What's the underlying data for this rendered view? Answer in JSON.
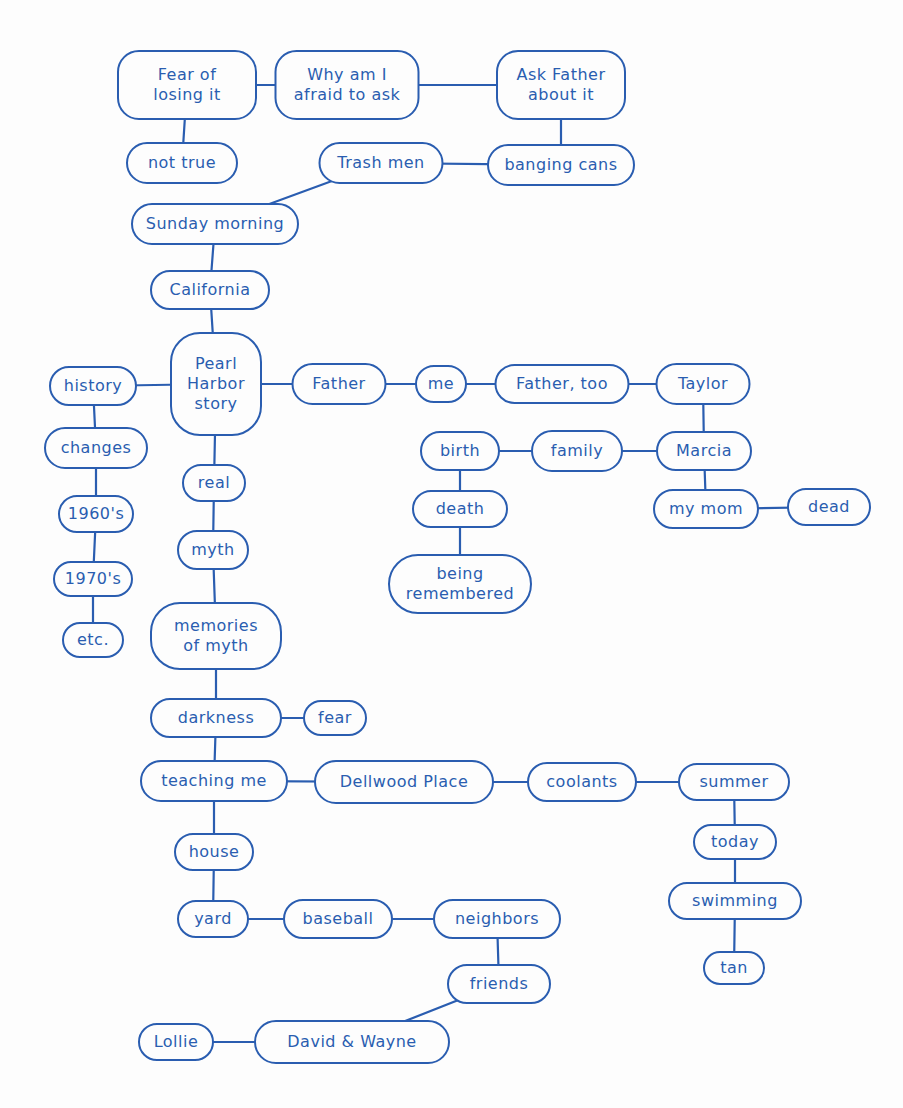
{
  "colors": {
    "stroke": "#2a5db0",
    "background": "#fdfdfd"
  },
  "nodes": [
    {
      "id": "fear-of-losing-it",
      "label": "Fear of\nlosing it",
      "x": 187,
      "y": 85,
      "w": 140,
      "h": 70
    },
    {
      "id": "why-am-i-afraid",
      "label": "Why am I\nafraid to ask",
      "x": 347,
      "y": 85,
      "w": 145,
      "h": 70
    },
    {
      "id": "ask-father",
      "label": "Ask Father\nabout it",
      "x": 561,
      "y": 85,
      "w": 130,
      "h": 70
    },
    {
      "id": "not-true",
      "label": "not true",
      "x": 182,
      "y": 163,
      "w": 112,
      "h": 42
    },
    {
      "id": "trash-men",
      "label": "Trash men",
      "x": 381,
      "y": 163,
      "w": 125,
      "h": 42
    },
    {
      "id": "banging-cans",
      "label": "banging cans",
      "x": 561,
      "y": 165,
      "w": 148,
      "h": 42
    },
    {
      "id": "sunday-morning",
      "label": "Sunday morning",
      "x": 215,
      "y": 224,
      "w": 168,
      "h": 42
    },
    {
      "id": "california",
      "label": "California",
      "x": 210,
      "y": 290,
      "w": 120,
      "h": 40
    },
    {
      "id": "pearl-harbor-story",
      "label": "Pearl\nHarbor\nstory",
      "x": 216,
      "y": 384,
      "w": 92,
      "h": 104,
      "big": true
    },
    {
      "id": "history",
      "label": "history",
      "x": 93,
      "y": 386,
      "w": 88,
      "h": 40
    },
    {
      "id": "father",
      "label": "Father",
      "x": 339,
      "y": 384,
      "w": 95,
      "h": 42
    },
    {
      "id": "me",
      "label": "me",
      "x": 441,
      "y": 384,
      "w": 52,
      "h": 38
    },
    {
      "id": "father-too",
      "label": "Father, too",
      "x": 562,
      "y": 384,
      "w": 135,
      "h": 40
    },
    {
      "id": "taylor",
      "label": "Taylor",
      "x": 703,
      "y": 384,
      "w": 95,
      "h": 42
    },
    {
      "id": "changes",
      "label": "changes",
      "x": 96,
      "y": 448,
      "w": 104,
      "h": 42
    },
    {
      "id": "birth",
      "label": "birth",
      "x": 460,
      "y": 451,
      "w": 80,
      "h": 40
    },
    {
      "id": "family",
      "label": "family",
      "x": 577,
      "y": 451,
      "w": 92,
      "h": 42
    },
    {
      "id": "marcia",
      "label": "Marcia",
      "x": 704,
      "y": 451,
      "w": 96,
      "h": 40
    },
    {
      "id": "real",
      "label": "real",
      "x": 214,
      "y": 483,
      "w": 64,
      "h": 38
    },
    {
      "id": "1960s",
      "label": "1960's",
      "x": 96,
      "y": 514,
      "w": 76,
      "h": 38
    },
    {
      "id": "death",
      "label": "death",
      "x": 460,
      "y": 509,
      "w": 96,
      "h": 38
    },
    {
      "id": "my-mom",
      "label": "my mom",
      "x": 706,
      "y": 509,
      "w": 106,
      "h": 40
    },
    {
      "id": "dead",
      "label": "dead",
      "x": 829,
      "y": 507,
      "w": 84,
      "h": 38
    },
    {
      "id": "myth",
      "label": "myth",
      "x": 213,
      "y": 550,
      "w": 72,
      "h": 40
    },
    {
      "id": "1970s",
      "label": "1970's",
      "x": 93,
      "y": 579,
      "w": 80,
      "h": 36
    },
    {
      "id": "being-remembered",
      "label": "being\nremembered",
      "x": 460,
      "y": 584,
      "w": 144,
      "h": 60,
      "big": true
    },
    {
      "id": "etc",
      "label": "etc.",
      "x": 93,
      "y": 640,
      "w": 62,
      "h": 36
    },
    {
      "id": "memories-of-myth",
      "label": "memories\nof myth",
      "x": 216,
      "y": 636,
      "w": 132,
      "h": 68,
      "big": true
    },
    {
      "id": "darkness",
      "label": "darkness",
      "x": 216,
      "y": 718,
      "w": 132,
      "h": 40
    },
    {
      "id": "fear",
      "label": "fear",
      "x": 335,
      "y": 718,
      "w": 64,
      "h": 36
    },
    {
      "id": "teaching-me",
      "label": "teaching me",
      "x": 214,
      "y": 781,
      "w": 148,
      "h": 42
    },
    {
      "id": "dellwood-place",
      "label": "Dellwood Place",
      "x": 404,
      "y": 782,
      "w": 180,
      "h": 44
    },
    {
      "id": "coolants",
      "label": "coolants",
      "x": 582,
      "y": 782,
      "w": 110,
      "h": 40
    },
    {
      "id": "summer",
      "label": "summer",
      "x": 734,
      "y": 782,
      "w": 112,
      "h": 38
    },
    {
      "id": "house",
      "label": "house",
      "x": 214,
      "y": 852,
      "w": 80,
      "h": 38
    },
    {
      "id": "today",
      "label": "today",
      "x": 735,
      "y": 842,
      "w": 84,
      "h": 36
    },
    {
      "id": "swimming",
      "label": "swimming",
      "x": 735,
      "y": 901,
      "w": 134,
      "h": 38
    },
    {
      "id": "yard",
      "label": "yard",
      "x": 213,
      "y": 919,
      "w": 72,
      "h": 38
    },
    {
      "id": "baseball",
      "label": "baseball",
      "x": 338,
      "y": 919,
      "w": 110,
      "h": 40
    },
    {
      "id": "neighbors",
      "label": "neighbors",
      "x": 497,
      "y": 919,
      "w": 128,
      "h": 40
    },
    {
      "id": "tan",
      "label": "tan",
      "x": 734,
      "y": 968,
      "w": 62,
      "h": 34
    },
    {
      "id": "friends",
      "label": "friends",
      "x": 499,
      "y": 984,
      "w": 104,
      "h": 40
    },
    {
      "id": "lollie",
      "label": "Lollie",
      "x": 176,
      "y": 1042,
      "w": 76,
      "h": 38
    },
    {
      "id": "david-wayne",
      "label": "David & Wayne",
      "x": 352,
      "y": 1042,
      "w": 196,
      "h": 44
    }
  ],
  "links": [
    [
      "fear-of-losing-it",
      "why-am-i-afraid"
    ],
    [
      "why-am-i-afraid",
      "ask-father"
    ],
    [
      "fear-of-losing-it",
      "not-true"
    ],
    [
      "ask-father",
      "banging-cans"
    ],
    [
      "banging-cans",
      "trash-men"
    ],
    [
      "trash-men",
      "sunday-morning"
    ],
    [
      "sunday-morning",
      "california"
    ],
    [
      "california",
      "pearl-harbor-story"
    ],
    [
      "pearl-harbor-story",
      "history"
    ],
    [
      "pearl-harbor-story",
      "father"
    ],
    [
      "father",
      "me"
    ],
    [
      "me",
      "father-too"
    ],
    [
      "father-too",
      "taylor"
    ],
    [
      "taylor",
      "marcia"
    ],
    [
      "marcia",
      "family"
    ],
    [
      "family",
      "birth"
    ],
    [
      "birth",
      "death"
    ],
    [
      "death",
      "being-remembered"
    ],
    [
      "marcia",
      "my-mom"
    ],
    [
      "my-mom",
      "dead"
    ],
    [
      "history",
      "changes"
    ],
    [
      "changes",
      "1960s"
    ],
    [
      "1960s",
      "1970s"
    ],
    [
      "1970s",
      "etc"
    ],
    [
      "pearl-harbor-story",
      "real"
    ],
    [
      "real",
      "myth"
    ],
    [
      "myth",
      "memories-of-myth"
    ],
    [
      "memories-of-myth",
      "darkness"
    ],
    [
      "darkness",
      "fear"
    ],
    [
      "darkness",
      "teaching-me"
    ],
    [
      "teaching-me",
      "dellwood-place"
    ],
    [
      "dellwood-place",
      "coolants"
    ],
    [
      "coolants",
      "summer"
    ],
    [
      "summer",
      "today"
    ],
    [
      "today",
      "swimming"
    ],
    [
      "swimming",
      "tan"
    ],
    [
      "teaching-me",
      "house"
    ],
    [
      "house",
      "yard"
    ],
    [
      "yard",
      "baseball"
    ],
    [
      "baseball",
      "neighbors"
    ],
    [
      "neighbors",
      "friends"
    ],
    [
      "friends",
      "david-wayne"
    ],
    [
      "david-wayne",
      "lollie"
    ]
  ]
}
